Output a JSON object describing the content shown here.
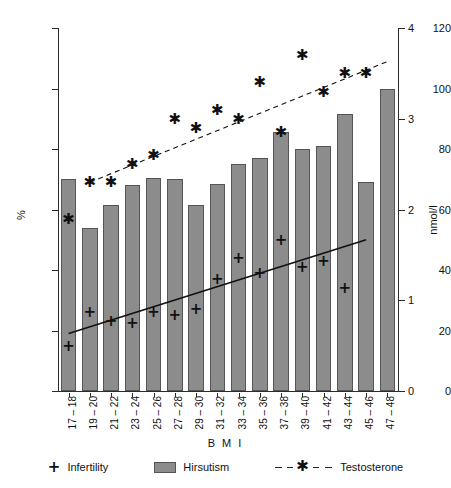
{
  "chart_data": {
    "type": "bar",
    "title": "",
    "xlabel": "B M I",
    "ylabel": "%",
    "y2label": "nmol/l",
    "ylim": [
      0,
      120
    ],
    "y2lim": [
      0,
      4
    ],
    "grid": false,
    "legend_position": "bottom",
    "categories": [
      "17 – 18",
      "19 – 20",
      "21 – 22",
      "23 – 24",
      "25 – 26",
      "27 – 28",
      "29 – 30",
      "31 – 32",
      "33 – 34",
      "35 – 36",
      "37 – 38",
      "39 – 40",
      "41 – 42",
      "43 – 44",
      "45 – 46",
      "47 – 48"
    ],
    "yticks": [
      0,
      20,
      40,
      60,
      80,
      100,
      120
    ],
    "y2ticks": [
      0,
      1,
      2,
      3,
      4
    ],
    "series": [
      {
        "name": "Hirsutism",
        "type": "bar",
        "axis": "left",
        "unit": "%",
        "color": "#8c8c8c",
        "values": [
          70,
          54,
          61.5,
          68,
          70.5,
          70,
          61.5,
          68.5,
          75,
          77,
          85.5,
          80,
          81,
          91.5,
          69,
          100
        ]
      },
      {
        "name": "Infertility",
        "type": "scatter",
        "axis": "left",
        "unit": "%",
        "marker": "plus",
        "color": "#111111",
        "values": [
          15,
          26,
          23,
          22.5,
          26,
          25,
          27,
          37,
          44,
          39,
          50,
          41,
          43,
          34,
          null,
          null
        ]
      },
      {
        "name": "Testosterone",
        "type": "scatter",
        "axis": "right",
        "unit": "nmol/l",
        "marker": "star",
        "color": "#111111",
        "values": [
          1.9,
          2.3,
          2.3,
          2.5,
          2.6,
          3.0,
          2.9,
          3.1,
          3.0,
          3.4,
          2.85,
          3.7,
          3.3,
          3.5,
          3.5,
          null
        ]
      }
    ],
    "trendlines": [
      {
        "name": "Infertility trend",
        "axis": "left",
        "style": "solid",
        "x0_index": 0,
        "y0": 19,
        "x1_index": 14,
        "y1": 50
      },
      {
        "name": "Testosterone trend",
        "axis": "right",
        "style": "dashed",
        "x0_index": 1,
        "y0": 2.3,
        "x1_index": 15,
        "y1": 3.63
      }
    ]
  },
  "legend": {
    "items": [
      {
        "label": "Infertility",
        "glyph": "plus-marker"
      },
      {
        "label": "Hirsutism",
        "glyph": "bar-swatch"
      },
      {
        "label": "Testosterone",
        "glyph": "dashed-star-line"
      }
    ]
  },
  "glyphs": {
    "plus": "+",
    "star": "✱"
  }
}
